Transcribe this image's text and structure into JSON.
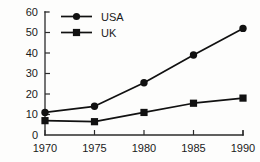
{
  "chart_data": {
    "type": "line",
    "title": "",
    "xlabel": "",
    "ylabel": "",
    "categories": [
      "1970",
      "1975",
      "1980",
      "1985",
      "1990"
    ],
    "x": [
      1970,
      1975,
      1980,
      1985,
      1990
    ],
    "xlim": [
      1970,
      1990
    ],
    "ylim": [
      0,
      60
    ],
    "yticks": [
      0,
      10,
      20,
      30,
      40,
      50,
      60
    ],
    "xticks": [
      1970,
      1975,
      1980,
      1985,
      1990
    ],
    "grid": false,
    "legend_position": "upper-left-inside",
    "series": [
      {
        "name": "USA",
        "marker": "circle",
        "color": "#111111",
        "values": [
          11,
          14,
          25.5,
          39,
          52
        ]
      },
      {
        "name": "UK",
        "marker": "square",
        "color": "#111111",
        "values": [
          7,
          6.5,
          11,
          15.5,
          18
        ]
      }
    ]
  },
  "axis": {
    "y_tick_labels": [
      "60",
      "50",
      "40",
      "30",
      "20",
      "10",
      "0"
    ],
    "x_tick_labels": [
      "1970",
      "1975",
      "1980",
      "1985",
      "1990"
    ]
  },
  "legend": {
    "entries": [
      {
        "label": "USA",
        "marker": "circle-marker-icon"
      },
      {
        "label": "UK",
        "marker": "square-marker-icon"
      }
    ]
  }
}
